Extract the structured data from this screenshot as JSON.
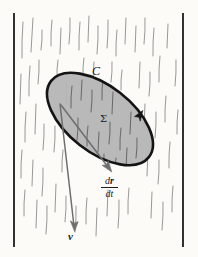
{
  "figure": {
    "name": "rain-flux-through-surface-diagram",
    "width": 198,
    "height": 257,
    "background_color": "#fcfbf8"
  },
  "labels": {
    "curve": "C",
    "surface": "Σ",
    "velocity": "v",
    "rate_numerator_d": "d",
    "rate_numerator_r": "r",
    "rate_denominator_d": "d",
    "rate_denominator_t": "t"
  },
  "colors": {
    "background": "#fcfbf8",
    "border_line": "#1a1a1a",
    "rain_streak": "#8c8c8c",
    "surface_fill": "#b5b5b5",
    "surface_outline": "#141414",
    "arrow": "#6e6e6e",
    "text": "#1c1c1c"
  },
  "geometry": {
    "left_border_x": 14,
    "right_border_x": 183,
    "border_top_y": 13,
    "border_bottom_y": 247,
    "ellipse": {
      "center_x": 100,
      "center_y": 119,
      "radius_x": 62,
      "radius_y": 33,
      "rotation_deg": 38,
      "stroke_width": 2.6
    },
    "direction_arrow_on_curve": {
      "tip_x": 143,
      "tip_y": 112,
      "description": "counterclockwise orientation marker on curve C"
    },
    "velocity_arrow": {
      "start_x": 60,
      "start_y": 104,
      "end_x": 74,
      "end_y": 229
    },
    "rate_arrow": {
      "start_x": 61,
      "start_y": 105,
      "end_x": 111,
      "end_y": 170
    }
  },
  "rain_streaks": [
    {
      "x1": 23,
      "y1": 22,
      "x2": 22,
      "y2": 58
    },
    {
      "x1": 33,
      "y1": 18,
      "x2": 31,
      "y2": 52
    },
    {
      "x1": 42,
      "y1": 30,
      "x2": 41,
      "y2": 50
    },
    {
      "x1": 30,
      "y1": 66,
      "x2": 29,
      "y2": 96
    },
    {
      "x1": 21,
      "y1": 74,
      "x2": 20,
      "y2": 104
    },
    {
      "x1": 39,
      "y1": 60,
      "x2": 38,
      "y2": 84
    },
    {
      "x1": 26,
      "y1": 112,
      "x2": 25,
      "y2": 142
    },
    {
      "x1": 36,
      "y1": 104,
      "x2": 35,
      "y2": 134
    },
    {
      "x1": 44,
      "y1": 124,
      "x2": 43,
      "y2": 150
    },
    {
      "x1": 22,
      "y1": 150,
      "x2": 21,
      "y2": 178
    },
    {
      "x1": 33,
      "y1": 160,
      "x2": 32,
      "y2": 186
    },
    {
      "x1": 43,
      "y1": 168,
      "x2": 42,
      "y2": 196
    },
    {
      "x1": 25,
      "y1": 190,
      "x2": 24,
      "y2": 216
    },
    {
      "x1": 37,
      "y1": 200,
      "x2": 36,
      "y2": 228
    },
    {
      "x1": 47,
      "y1": 206,
      "x2": 46,
      "y2": 234
    },
    {
      "x1": 52,
      "y1": 20,
      "x2": 51,
      "y2": 46
    },
    {
      "x1": 61,
      "y1": 28,
      "x2": 60,
      "y2": 54
    },
    {
      "x1": 70,
      "y1": 18,
      "x2": 69,
      "y2": 44
    },
    {
      "x1": 58,
      "y1": 60,
      "x2": 57,
      "y2": 78
    },
    {
      "x1": 67,
      "y1": 84,
      "x2": 66,
      "y2": 104
    },
    {
      "x1": 55,
      "y1": 126,
      "x2": 54,
      "y2": 152
    },
    {
      "x1": 63,
      "y1": 150,
      "x2": 62,
      "y2": 172
    },
    {
      "x1": 56,
      "y1": 184,
      "x2": 55,
      "y2": 212
    },
    {
      "x1": 66,
      "y1": 196,
      "x2": 65,
      "y2": 222
    },
    {
      "x1": 80,
      "y1": 22,
      "x2": 79,
      "y2": 50
    },
    {
      "x1": 89,
      "y1": 16,
      "x2": 88,
      "y2": 42
    },
    {
      "x1": 98,
      "y1": 26,
      "x2": 97,
      "y2": 54
    },
    {
      "x1": 84,
      "y1": 58,
      "x2": 83,
      "y2": 76
    },
    {
      "x1": 94,
      "y1": 62,
      "x2": 93,
      "y2": 80
    },
    {
      "x1": 76,
      "y1": 206,
      "x2": 75,
      "y2": 232
    },
    {
      "x1": 87,
      "y1": 198,
      "x2": 86,
      "y2": 224
    },
    {
      "x1": 97,
      "y1": 208,
      "x2": 96,
      "y2": 236
    },
    {
      "x1": 108,
      "y1": 20,
      "x2": 107,
      "y2": 48
    },
    {
      "x1": 117,
      "y1": 30,
      "x2": 116,
      "y2": 56
    },
    {
      "x1": 126,
      "y1": 18,
      "x2": 125,
      "y2": 44
    },
    {
      "x1": 112,
      "y1": 62,
      "x2": 111,
      "y2": 82
    },
    {
      "x1": 122,
      "y1": 70,
      "x2": 121,
      "y2": 90
    },
    {
      "x1": 108,
      "y1": 190,
      "x2": 107,
      "y2": 216
    },
    {
      "x1": 119,
      "y1": 200,
      "x2": 118,
      "y2": 228
    },
    {
      "x1": 129,
      "y1": 188,
      "x2": 128,
      "y2": 214
    },
    {
      "x1": 136,
      "y1": 26,
      "x2": 135,
      "y2": 52
    },
    {
      "x1": 145,
      "y1": 18,
      "x2": 144,
      "y2": 44
    },
    {
      "x1": 154,
      "y1": 28,
      "x2": 153,
      "y2": 56
    },
    {
      "x1": 140,
      "y1": 62,
      "x2": 139,
      "y2": 88
    },
    {
      "x1": 150,
      "y1": 72,
      "x2": 149,
      "y2": 96
    },
    {
      "x1": 160,
      "y1": 56,
      "x2": 159,
      "y2": 82
    },
    {
      "x1": 145,
      "y1": 104,
      "x2": 144,
      "y2": 128
    },
    {
      "x1": 156,
      "y1": 112,
      "x2": 155,
      "y2": 138
    },
    {
      "x1": 166,
      "y1": 96,
      "x2": 165,
      "y2": 122
    },
    {
      "x1": 148,
      "y1": 150,
      "x2": 147,
      "y2": 176
    },
    {
      "x1": 159,
      "y1": 160,
      "x2": 158,
      "y2": 184
    },
    {
      "x1": 170,
      "y1": 142,
      "x2": 169,
      "y2": 168
    },
    {
      "x1": 152,
      "y1": 192,
      "x2": 151,
      "y2": 218
    },
    {
      "x1": 163,
      "y1": 202,
      "x2": 162,
      "y2": 230
    },
    {
      "x1": 173,
      "y1": 186,
      "x2": 172,
      "y2": 212
    },
    {
      "x1": 168,
      "y1": 24,
      "x2": 167,
      "y2": 48
    },
    {
      "x1": 176,
      "y1": 60,
      "x2": 175,
      "y2": 86
    },
    {
      "x1": 178,
      "y1": 110,
      "x2": 177,
      "y2": 134
    }
  ],
  "rain_streaks_over_surface": [
    {
      "x1": 72,
      "y1": 86,
      "x2": 71,
      "y2": 108
    },
    {
      "x1": 82,
      "y1": 80,
      "x2": 81,
      "y2": 100
    },
    {
      "x1": 92,
      "y1": 90,
      "x2": 91,
      "y2": 112
    },
    {
      "x1": 103,
      "y1": 78,
      "x2": 102,
      "y2": 100
    },
    {
      "x1": 113,
      "y1": 92,
      "x2": 112,
      "y2": 114
    },
    {
      "x1": 78,
      "y1": 118,
      "x2": 77,
      "y2": 140
    },
    {
      "x1": 88,
      "y1": 126,
      "x2": 87,
      "y2": 146
    },
    {
      "x1": 99,
      "y1": 132,
      "x2": 98,
      "y2": 152
    },
    {
      "x1": 110,
      "y1": 122,
      "x2": 109,
      "y2": 144
    },
    {
      "x1": 121,
      "y1": 128,
      "x2": 120,
      "y2": 150
    },
    {
      "x1": 131,
      "y1": 112,
      "x2": 130,
      "y2": 134
    },
    {
      "x1": 104,
      "y1": 154,
      "x2": 103,
      "y2": 172
    },
    {
      "x1": 116,
      "y1": 158,
      "x2": 115,
      "y2": 176
    },
    {
      "x1": 127,
      "y1": 148,
      "x2": 126,
      "y2": 168
    },
    {
      "x1": 137,
      "y1": 138,
      "x2": 136,
      "y2": 158
    }
  ]
}
